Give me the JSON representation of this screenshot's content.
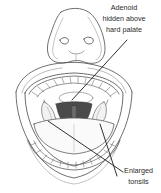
{
  "figure": {
    "style": "pencil line drawing",
    "background_color": "#ffffff",
    "line_color": "#3a3a3a",
    "shading_color": "#8e8e8e",
    "throat_dark_color": "#4a4a4a",
    "parts": [
      "nose",
      "nostrils",
      "upper lip",
      "lower lip",
      "upper teeth",
      "lower teeth",
      "hard palate",
      "uvula",
      "soft palate",
      "tongue",
      "left tonsil",
      "right tonsil",
      "throat"
    ]
  },
  "labels": {
    "adenoid": {
      "line1": "Adenoid",
      "line2": "hidden above",
      "line3": "hard palate"
    },
    "tonsils": {
      "line1": "Enlarged",
      "line2": "tonsils"
    }
  },
  "leader_lines": {
    "adenoid": "from text down-left to hard palate oval",
    "tonsils_left": "from text up-left to left tonsil",
    "tonsils_right": "from text up-left to right tonsil"
  }
}
